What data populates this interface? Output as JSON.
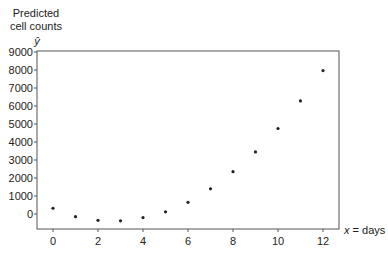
{
  "chart_data": {
    "type": "scatter",
    "title": "",
    "ylabel_lines": [
      "Predicted",
      "cell counts"
    ],
    "ylabel_symbol": "ŷ",
    "xlabel": "x = days",
    "xlim": [
      -0.7,
      12.7
    ],
    "ylim": [
      -850,
      9000
    ],
    "x_ticks": [
      0,
      2,
      4,
      6,
      8,
      10,
      12
    ],
    "y_ticks": [
      0,
      1000,
      2000,
      3000,
      4000,
      5000,
      6000,
      7000,
      8000,
      9000
    ],
    "grid": false,
    "legend": null,
    "series": [
      {
        "name": "Predicted cell counts",
        "x": [
          0,
          1,
          2,
          3,
          4,
          5,
          6,
          7,
          8,
          9,
          10,
          11,
          12
        ],
        "y": [
          320,
          -150,
          -350,
          -380,
          -200,
          120,
          650,
          1400,
          2350,
          3450,
          4750,
          6280,
          7970
        ],
        "color": "#222222"
      }
    ]
  }
}
